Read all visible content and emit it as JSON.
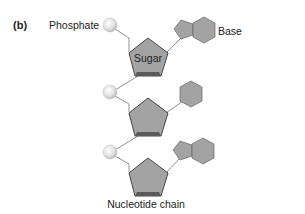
{
  "figure": {
    "panel_label": "(b)",
    "caption": "Nucleotide chain"
  },
  "labels": {
    "phosphate": "Phosphate",
    "sugar": "Sugar",
    "base": "Base"
  },
  "nucleotides": [
    {
      "index": 1,
      "phosphate": "sphere",
      "sugar": "pentagon",
      "base": "purine (pentagon + hexagon)"
    },
    {
      "index": 2,
      "phosphate": "sphere",
      "sugar": "pentagon",
      "base": "pyrimidine (hexagon)"
    },
    {
      "index": 3,
      "phosphate": "sphere",
      "sugar": "pentagon",
      "base": "purine (pentagon + hexagon)"
    }
  ],
  "colors": {
    "shape_fill": "#a3a3a3",
    "shape_stroke": "#555555",
    "sugar_bottom": "#5a5a5a",
    "phosphate_fill": "#e6e6e6",
    "line": "#777777",
    "text": "#222222"
  }
}
